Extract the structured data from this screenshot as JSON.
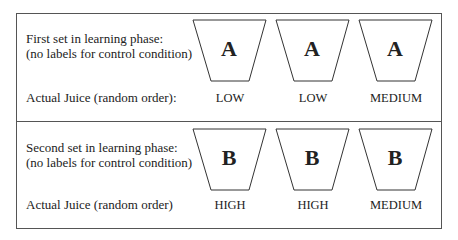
{
  "rows": [
    {
      "set_label_line1": "First set in learning phase:",
      "set_label_line2": "(no labels for control condition)",
      "juice_label": "Actual Juice (random order):",
      "cups": [
        {
          "letter": "A",
          "juice": "LOW"
        },
        {
          "letter": "A",
          "juice": "LOW"
        },
        {
          "letter": "A",
          "juice": "MEDIUM"
        }
      ]
    },
    {
      "set_label_line1": "Second set in learning phase:",
      "set_label_line2": "(no labels for control condition)",
      "juice_label": "Actual Juice (random order)",
      "cups": [
        {
          "letter": "B",
          "juice": "HIGH"
        },
        {
          "letter": "B",
          "juice": "HIGH"
        },
        {
          "letter": "B",
          "juice": "MEDIUM"
        }
      ]
    }
  ],
  "colors": {
    "line": "#555555",
    "text": "#222222"
  }
}
